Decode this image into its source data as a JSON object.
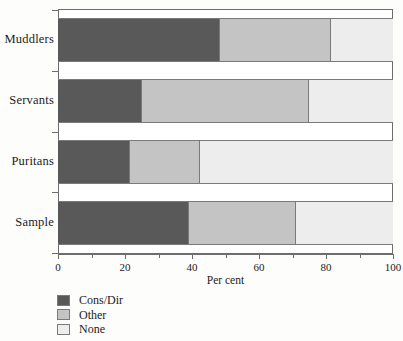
{
  "chart_data": {
    "type": "bar",
    "orientation": "horizontal",
    "stacked": true,
    "stack_total": 100,
    "title": "",
    "xlabel": "Per cent",
    "ylabel": "",
    "xlim": [
      0,
      100
    ],
    "xticks": [
      0,
      20,
      40,
      60,
      80,
      100
    ],
    "xtick_labels": [
      "0",
      "20",
      "40",
      "60",
      "80",
      "100"
    ],
    "xminor_ticks": [
      10,
      30,
      50,
      70,
      90
    ],
    "grid": false,
    "legend_position": "below-axis-left",
    "categories": [
      "Muddlers",
      "Servants",
      "Puritans",
      "Sample"
    ],
    "series": [
      {
        "name": "Cons/Dir",
        "color": "#595959",
        "values": [
          48.5,
          25,
          21.5,
          39
        ]
      },
      {
        "name": "Other",
        "color": "#c4c4c4",
        "values": [
          33,
          50,
          21,
          32
        ]
      },
      {
        "name": "None",
        "color": "#ededed",
        "values": [
          18.5,
          25,
          57.5,
          29
        ]
      }
    ],
    "cumulative_boundaries": {
      "Muddlers": [
        48.5,
        81.5
      ],
      "Servants": [
        25,
        75
      ],
      "Puritans": [
        21.5,
        42.5
      ],
      "Sample": [
        39,
        71
      ]
    }
  },
  "legend": {
    "items": [
      {
        "label": "Cons/Dir",
        "color": "#595959"
      },
      {
        "label": "Other",
        "color": "#c4c4c4"
      },
      {
        "label": "None",
        "color": "#ededed"
      }
    ]
  },
  "axis": {
    "x_title": "Per cent"
  },
  "colors": {
    "cons_dir": "#595959",
    "other": "#c4c4c4",
    "none": "#ededed",
    "frame": "#6d6d6d",
    "text": "#1b1b1b"
  }
}
